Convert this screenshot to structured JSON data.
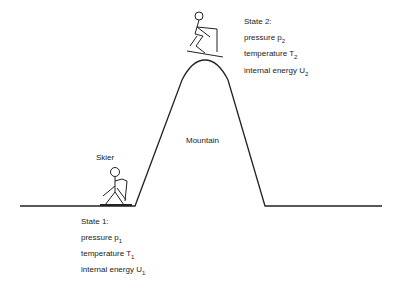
{
  "labels": {
    "skier": "Skier",
    "mountain": "Mountain"
  },
  "state1": {
    "title": "State 1:",
    "pressure": "pressure p",
    "pressure_sub": "1",
    "temperature": "temperature T",
    "temperature_sub": "1",
    "energy": "internal energy U",
    "energy_sub": "1"
  },
  "state2": {
    "title": "State 2:",
    "pressure": "pressure p",
    "pressure_sub": "2",
    "temperature": "temperature T",
    "temperature_sub": "2",
    "energy": "internal energy U",
    "energy_sub": "2"
  },
  "colors": {
    "line": "#222222"
  }
}
